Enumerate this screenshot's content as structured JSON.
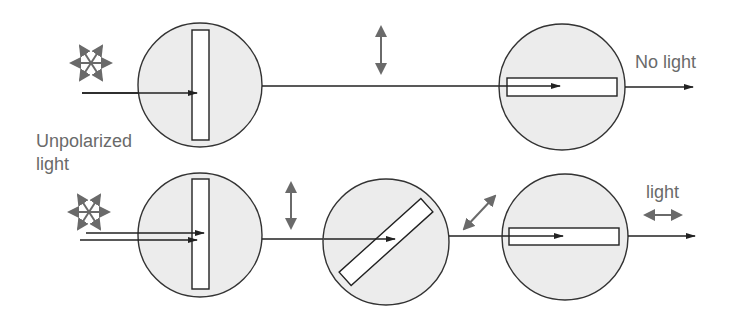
{
  "diagram": {
    "colors": {
      "background": "#ffffff",
      "disc_fill": "#ececec",
      "outline": "#333333",
      "beam": "#222222",
      "polarization_arrow": "#6a6a6a",
      "label_text": "#6a6a6a"
    },
    "labels": {
      "unpolarized_line1": "Unpolarized",
      "unpolarized_line2": "light",
      "top_output": "No light",
      "bottom_output": "light"
    },
    "rows": [
      {
        "name": "crossed-polarizers",
        "input": "unpolarized light",
        "filters": [
          {
            "orientation": "vertical",
            "angle_deg": 90
          },
          {
            "orientation": "horizontal",
            "angle_deg": 0
          }
        ],
        "between_polarization": [
          "vertical"
        ],
        "output": "No light"
      },
      {
        "name": "three-polarizers",
        "input": "unpolarized light",
        "filters": [
          {
            "orientation": "vertical",
            "angle_deg": 90
          },
          {
            "orientation": "diagonal",
            "angle_deg": 45
          },
          {
            "orientation": "horizontal",
            "angle_deg": 0
          }
        ],
        "between_polarization": [
          "vertical",
          "diagonal"
        ],
        "output": "light",
        "output_polarization": "horizontal"
      }
    ]
  }
}
